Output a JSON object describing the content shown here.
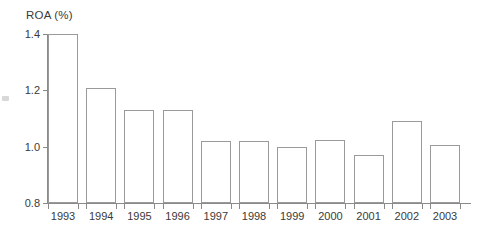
{
  "chart_data": {
    "type": "bar",
    "title": "ROA (%)",
    "xlabel": "",
    "ylabel": "",
    "ylim": [
      0.8,
      1.4
    ],
    "yticks": [
      0.8,
      1.0,
      1.2,
      1.4
    ],
    "ytick_labels": [
      "0.8",
      "1.0",
      "1.2",
      "1.4"
    ],
    "grid": false,
    "legend": null,
    "categories": [
      "1993",
      "1994",
      "1995",
      "1996",
      "1997",
      "1998",
      "1999",
      "2000",
      "2001",
      "2002",
      "2003"
    ],
    "values": [
      1.4,
      1.21,
      1.13,
      1.13,
      1.02,
      1.02,
      1.0,
      1.025,
      0.97,
      1.09,
      1.005
    ],
    "bar_style": {
      "fill": "#ffffff",
      "edge": "#9a9a9a"
    }
  },
  "axes": {
    "axis_color": "#8a8a8a",
    "text_color": "#3a3a3a"
  }
}
